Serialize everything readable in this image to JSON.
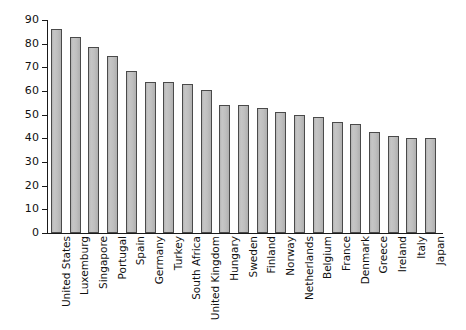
{
  "chart_data": {
    "type": "bar",
    "title": "",
    "subtitle": "",
    "xlabel": "",
    "ylabel": "",
    "ylim": [
      0,
      90
    ],
    "ytick_step": 10,
    "yticks": [
      90,
      80,
      70,
      60,
      50,
      40,
      30,
      20,
      10,
      0
    ],
    "grid": false,
    "legend": null,
    "orientation": "vertical",
    "bar_color": "#bdbdbd",
    "bar_edge_color": "#4a4a4a",
    "axis_color": "#1a1a1a",
    "background_color": "#ffffff",
    "categories": [
      "United States",
      "Luxemburg",
      "Singapore",
      "Portugal",
      "Spain",
      "Germany",
      "Turkey",
      "South Africa",
      "United Kingdom",
      "Hungary",
      "Sweden",
      "Finland",
      "Norway",
      "Netherlands",
      "Belgium",
      "France",
      "Denmark",
      "Greece",
      "Ireland",
      "Italy",
      "Japan"
    ],
    "values": [
      86.0,
      83.0,
      78.5,
      75.0,
      68.5,
      64.0,
      63.7,
      63.0,
      60.3,
      54.3,
      54.3,
      52.8,
      51.2,
      50.0,
      49.0,
      47.0,
      46.0,
      42.5,
      41.0,
      40.2,
      40.0
    ]
  }
}
